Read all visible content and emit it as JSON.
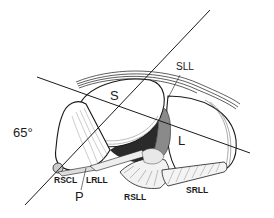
{
  "figure": {
    "type": "anatomical line drawing",
    "colors": {
      "ink": "#1a1a1a",
      "background": "#ffffff",
      "shade_dark": "#2a2a2a",
      "shade_mid": "#8a8a8a",
      "shade_light": "#d8d8d8"
    },
    "angle_label": "65°",
    "regions": [
      {
        "id": "S",
        "label": "S"
      },
      {
        "id": "L",
        "label": "L"
      },
      {
        "id": "P",
        "label": "P"
      }
    ],
    "ligaments": [
      {
        "id": "SLL",
        "label": "SLL"
      },
      {
        "id": "RSCL",
        "label": "RSCL"
      },
      {
        "id": "LRLL",
        "label": "LRLL"
      },
      {
        "id": "RSLL",
        "label": "RSLL"
      },
      {
        "id": "SRLL",
        "label": "SRLL"
      }
    ],
    "reference_lines": [
      {
        "id": "axis-65",
        "from": [
          25,
          205
        ],
        "to": [
          210,
          10
        ]
      },
      {
        "id": "oblique-axis",
        "from": [
          37,
          77
        ],
        "to": [
          250,
          153
        ]
      }
    ]
  }
}
